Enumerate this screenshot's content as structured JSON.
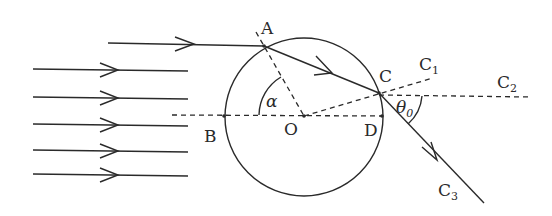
{
  "diagram": {
    "points": {
      "A": {
        "label": "A",
        "x": 264,
        "y": 46
      },
      "B": {
        "label": "B",
        "x": 224,
        "y": 116
      },
      "O": {
        "label": "O",
        "x": 304,
        "y": 116
      },
      "C": {
        "label": "C",
        "x": 379,
        "y": 93
      },
      "D": {
        "label": "D",
        "x": 382,
        "y": 116
      }
    },
    "ray_labels": {
      "C1": {
        "base": "C",
        "sub": "1"
      },
      "C2": {
        "base": "C",
        "sub": "2"
      },
      "C3": {
        "base": "C",
        "sub": "3"
      }
    },
    "angles": {
      "alpha": {
        "label": "α"
      },
      "theta0": {
        "base": "θ",
        "sub": "0"
      }
    },
    "circle": {
      "cx": 304,
      "cy": 116,
      "r": 79
    },
    "parallel_rays_count": 5,
    "colors": {
      "ink": "#2a2a2a",
      "background": "#ffffff"
    }
  }
}
